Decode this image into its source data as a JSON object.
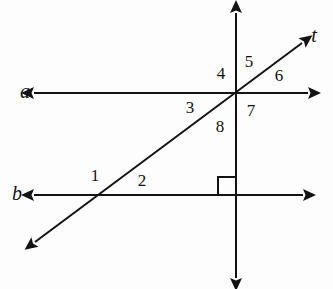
{
  "diagram": {
    "type": "geometry-figure",
    "canvas": {
      "width": 333,
      "height": 289,
      "background": "#fdfdfd"
    },
    "ink_color": "#131313",
    "lines": [
      {
        "id": "line-a",
        "label": "a",
        "label_x": 25,
        "label_y": 93,
        "orientation": "horizontal",
        "x1": 34,
        "y1": 93,
        "x2": 308,
        "y2": 93,
        "arrow_start": true,
        "arrow_end": true
      },
      {
        "id": "line-b",
        "label": "b",
        "label_x": 17,
        "label_y": 195,
        "orientation": "horizontal",
        "x1": 34,
        "y1": 195,
        "x2": 303,
        "y2": 195,
        "arrow_start": true,
        "arrow_end": true
      },
      {
        "id": "line-t",
        "label": "t",
        "label_x": 314,
        "label_y": 37,
        "orientation": "transversal",
        "x1": 35,
        "y1": 242,
        "x2": 302,
        "y2": 43,
        "arrow_start": true,
        "arrow_end": true
      },
      {
        "id": "line-vertical",
        "label": "",
        "label_x": 0,
        "label_y": 0,
        "orientation": "vertical",
        "x1": 236,
        "y1": 13,
        "x2": 236,
        "y2": 278,
        "arrow_start": true,
        "arrow_end": true
      }
    ],
    "intersections": [
      {
        "id": "upper-intersection",
        "x": 236,
        "y": 93
      },
      {
        "id": "lower-intersection-transversal-b",
        "x": 102,
        "y": 195
      },
      {
        "id": "lower-intersection-vertical-b",
        "x": 236,
        "y": 195
      }
    ],
    "right_angle_marker": {
      "id": "right-angle-b-vertical",
      "corner_x": 236,
      "corner_y": 195,
      "size": 18,
      "direction": "upper-left"
    },
    "angle_labels": [
      {
        "id": "angle-1",
        "text": "1",
        "x": 95,
        "y": 177
      },
      {
        "id": "angle-2",
        "text": "2",
        "x": 142,
        "y": 182
      },
      {
        "id": "angle-3",
        "text": "3",
        "x": 190,
        "y": 109
      },
      {
        "id": "angle-4",
        "text": "4",
        "x": 221,
        "y": 75
      },
      {
        "id": "angle-5",
        "text": "5",
        "x": 249,
        "y": 63
      },
      {
        "id": "angle-6",
        "text": "6",
        "x": 279,
        "y": 77
      },
      {
        "id": "angle-7",
        "text": "7",
        "x": 251,
        "y": 112
      },
      {
        "id": "angle-8",
        "text": "8",
        "x": 220,
        "y": 128
      }
    ]
  }
}
